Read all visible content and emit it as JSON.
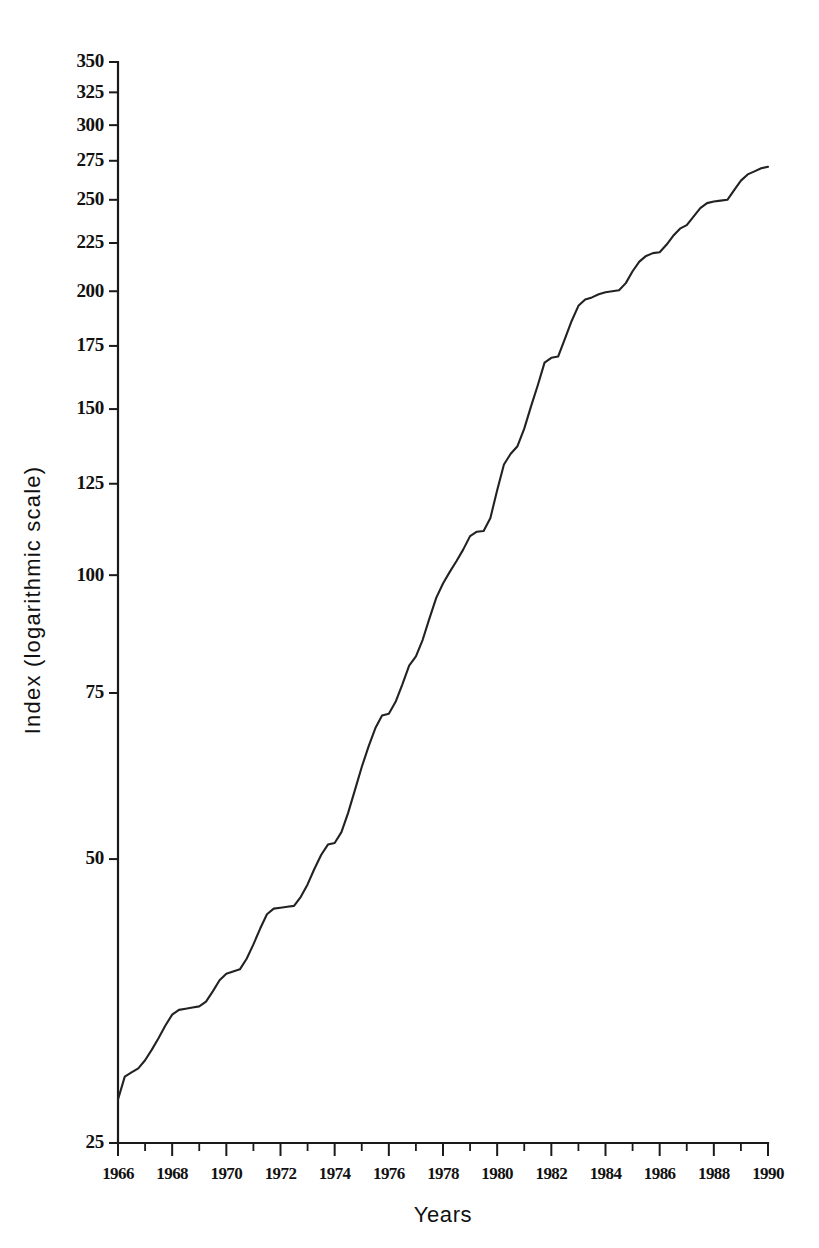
{
  "chart_data": {
    "type": "line",
    "title": "",
    "xlabel": "Years",
    "ylabel": "Index (logarithmic scale)",
    "yscale": "log",
    "xlim": [
      1966,
      1990
    ],
    "ylim": [
      25,
      350
    ],
    "grid": false,
    "legend": "none",
    "line_color": "#222222",
    "yticks": [
      25,
      50,
      75,
      100,
      125,
      150,
      175,
      200,
      225,
      250,
      275,
      300,
      325,
      350
    ],
    "ytick_labels": [
      "25",
      "50",
      "75",
      "100",
      "125",
      "150",
      "175",
      "200",
      "225",
      "250",
      "275",
      "300",
      "325",
      "350"
    ],
    "xticks_major": [
      1966,
      1968,
      1970,
      1972,
      1974,
      1976,
      1978,
      1980,
      1982,
      1984,
      1986,
      1988,
      1990
    ],
    "xtick_labels": [
      "1966",
      "1968",
      "1970",
      "1972",
      "1974",
      "1976",
      "1978",
      "1980",
      "1982",
      "1984",
      "1986",
      "1988",
      "1990"
    ],
    "xticks_minor": [
      1967,
      1969,
      1971,
      1973,
      1975,
      1977,
      1979,
      1981,
      1983,
      1985,
      1987,
      1989
    ],
    "x": [
      1966.0,
      1966.25,
      1966.5,
      1966.75,
      1967.0,
      1967.25,
      1967.5,
      1967.75,
      1968.0,
      1968.25,
      1968.5,
      1968.75,
      1969.0,
      1969.25,
      1969.5,
      1969.75,
      1970.0,
      1970.25,
      1970.5,
      1970.75,
      1971.0,
      1971.25,
      1971.5,
      1971.75,
      1972.0,
      1972.25,
      1972.5,
      1972.75,
      1973.0,
      1973.25,
      1973.5,
      1973.75,
      1974.0,
      1974.25,
      1974.5,
      1974.75,
      1975.0,
      1975.25,
      1975.5,
      1975.75,
      1976.0,
      1976.25,
      1976.5,
      1976.75,
      1977.0,
      1977.25,
      1977.5,
      1977.75,
      1978.0,
      1978.25,
      1978.5,
      1978.75,
      1979.0,
      1979.25,
      1979.5,
      1979.75,
      1980.0,
      1980.25,
      1980.5,
      1980.75,
      1981.0,
      1981.25,
      1981.5,
      1981.75,
      1982.0,
      1982.25,
      1982.5,
      1982.75,
      1983.0,
      1983.25,
      1983.5,
      1983.75,
      1984.0,
      1984.25,
      1984.5,
      1984.75,
      1985.0,
      1985.25,
      1985.5,
      1985.75,
      1986.0,
      1986.25,
      1986.5,
      1986.75,
      1987.0,
      1987.25,
      1987.5,
      1987.75,
      1988.0,
      1988.25,
      1988.5,
      1988.75,
      1989.0,
      1989.25,
      1989.5,
      1989.75,
      1990.0
    ],
    "y": [
      27.8,
      29.4,
      29.7,
      30.0,
      30.6,
      31.4,
      32.3,
      33.3,
      34.2,
      34.6,
      34.7,
      34.8,
      34.9,
      35.3,
      36.2,
      37.2,
      37.8,
      38.0,
      38.2,
      39.2,
      40.6,
      42.2,
      43.7,
      44.3,
      44.4,
      44.5,
      44.6,
      45.6,
      47.0,
      48.8,
      50.5,
      51.8,
      52.0,
      53.4,
      56.0,
      59.2,
      62.6,
      65.8,
      68.8,
      71.0,
      71.3,
      73.4,
      76.6,
      80.2,
      82.0,
      85.4,
      90.0,
      94.6,
      98.0,
      100.8,
      103.5,
      106.5,
      110.0,
      111.2,
      111.4,
      115.0,
      123.0,
      131.0,
      134.5,
      137.0,
      143.0,
      151.0,
      159.0,
      168.0,
      170.0,
      170.5,
      178.0,
      186.0,
      193.0,
      196.0,
      197.0,
      198.5,
      199.5,
      200.0,
      200.5,
      204.0,
      210.0,
      215.0,
      218.0,
      219.5,
      220.0,
      224.0,
      229.0,
      233.0,
      235.0,
      240.0,
      245.0,
      248.0,
      249.0,
      249.5,
      250.0,
      256.0,
      262.0,
      266.0,
      268.0,
      270.0,
      271.0,
      276.0,
      281.0,
      284.0,
      285.0,
      290.0,
      295.0,
      298.0,
      299.0,
      305.0,
      311.0,
      313.0,
      313.5,
      319.0,
      324.0
    ]
  }
}
